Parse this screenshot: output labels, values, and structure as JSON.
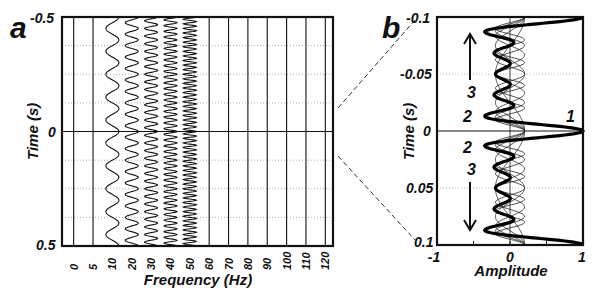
{
  "chart_data": [
    {
      "panel": "a",
      "type": "line",
      "title": "",
      "xlabel": "Frequency (Hz)",
      "ylabel": "Time (s)",
      "x_ticks": [
        "0",
        "5",
        "10",
        "20",
        "30",
        "40",
        "50",
        "60",
        "70",
        "80",
        "90",
        "100",
        "110",
        "120"
      ],
      "y_ticks": [
        "-0.5",
        "0",
        "0.5"
      ],
      "ylim": [
        -0.5,
        0.5
      ],
      "grid": {
        "horizontal_dotted": true
      },
      "series": [
        {
          "name": "0 Hz",
          "frequency": 0,
          "amplitude": 0
        },
        {
          "name": "5 Hz",
          "frequency": 5,
          "amplitude": 0
        },
        {
          "name": "10 Hz",
          "frequency": 10,
          "amplitude": 1
        },
        {
          "name": "20 Hz",
          "frequency": 20,
          "amplitude": 1
        },
        {
          "name": "30 Hz",
          "frequency": 30,
          "amplitude": 1
        },
        {
          "name": "40 Hz",
          "frequency": 40,
          "amplitude": 1
        },
        {
          "name": "50 Hz",
          "frequency": 50,
          "amplitude": 1
        },
        {
          "name": "60 Hz",
          "frequency": 60,
          "amplitude": 0
        },
        {
          "name": "70 Hz",
          "frequency": 70,
          "amplitude": 0
        },
        {
          "name": "80 Hz",
          "frequency": 80,
          "amplitude": 0
        },
        {
          "name": "90 Hz",
          "frequency": 90,
          "amplitude": 0
        },
        {
          "name": "100 Hz",
          "frequency": 100,
          "amplitude": 0
        },
        {
          "name": "110 Hz",
          "frequency": 110,
          "amplitude": 0
        },
        {
          "name": "120 Hz",
          "frequency": 120,
          "amplitude": 0
        }
      ]
    },
    {
      "panel": "b",
      "type": "line",
      "title": "",
      "xlabel": "Amplitude",
      "ylabel": "Time (s)",
      "x_ticks": [
        "-1",
        "0",
        "1"
      ],
      "y_ticks": [
        "-0.1",
        "-0.05",
        "0",
        "0.05",
        "0.1"
      ],
      "xlim": [
        -1,
        1
      ],
      "ylim": [
        -0.1,
        0.1
      ],
      "annotations": [
        "1",
        "2",
        "2",
        "3",
        "3"
      ],
      "series": [
        {
          "name": "sum of components (bold)",
          "peak_amplitude": 1.0,
          "peak_time": 0
        }
      ]
    }
  ],
  "panels": {
    "a": {
      "letter": "a"
    },
    "b": {
      "letter": "b"
    }
  }
}
